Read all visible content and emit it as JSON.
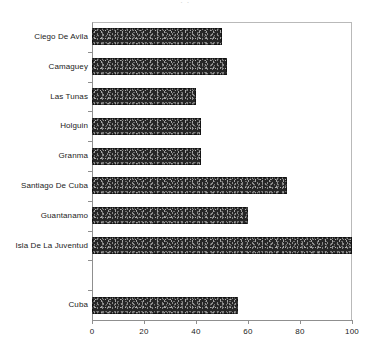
{
  "chart": {
    "title": "",
    "title_remnant": "·   ·",
    "xlabel": "",
    "ylabel": ""
  },
  "chart_data": {
    "type": "bar",
    "orientation": "horizontal",
    "title": "",
    "xlabel": "",
    "ylabel": "",
    "categories": [
      "Ciego De Avila",
      "Camaguey",
      "Las Tunas",
      "Holguin",
      "Granma",
      "Santiago De Cuba",
      "Guantanamo",
      "Isla De La Juventud",
      "Cuba"
    ],
    "values": [
      50,
      52,
      40,
      42,
      42,
      75,
      60,
      100,
      56
    ],
    "xlim": [
      0,
      100
    ],
    "xticks": [
      0,
      20,
      40,
      60,
      80,
      100
    ],
    "xtick_labels": [
      "0",
      "20",
      "40",
      "60",
      "80",
      "100"
    ],
    "grid": false,
    "legend": false,
    "bar_color": "#262626",
    "note": "A blank row separates 'Isla De La Juventud' from the summary row 'Cuba'."
  },
  "axis": {
    "ticks": [
      {
        "label": "0",
        "value": 0
      },
      {
        "label": "20",
        "value": 20
      },
      {
        "label": "40",
        "value": 40
      },
      {
        "label": "60",
        "value": 60
      },
      {
        "label": "80",
        "value": 80
      },
      {
        "label": "100",
        "value": 100
      }
    ]
  },
  "rows": [
    {
      "label": "Ciego De Avila",
      "value": 50,
      "blank": false
    },
    {
      "label": "Camaguey",
      "value": 52,
      "blank": false
    },
    {
      "label": "Las Tunas",
      "value": 40,
      "blank": false
    },
    {
      "label": "Holguin",
      "value": 42,
      "blank": false
    },
    {
      "label": "Granma",
      "value": 42,
      "blank": false
    },
    {
      "label": "Santiago De Cuba",
      "value": 75,
      "blank": false
    },
    {
      "label": "Guantanamo",
      "value": 60,
      "blank": false
    },
    {
      "label": "Isla De La Juventud",
      "value": 100,
      "blank": false
    },
    {
      "label": "",
      "value": 0,
      "blank": true
    },
    {
      "label": "Cuba",
      "value": 56,
      "blank": false
    }
  ]
}
